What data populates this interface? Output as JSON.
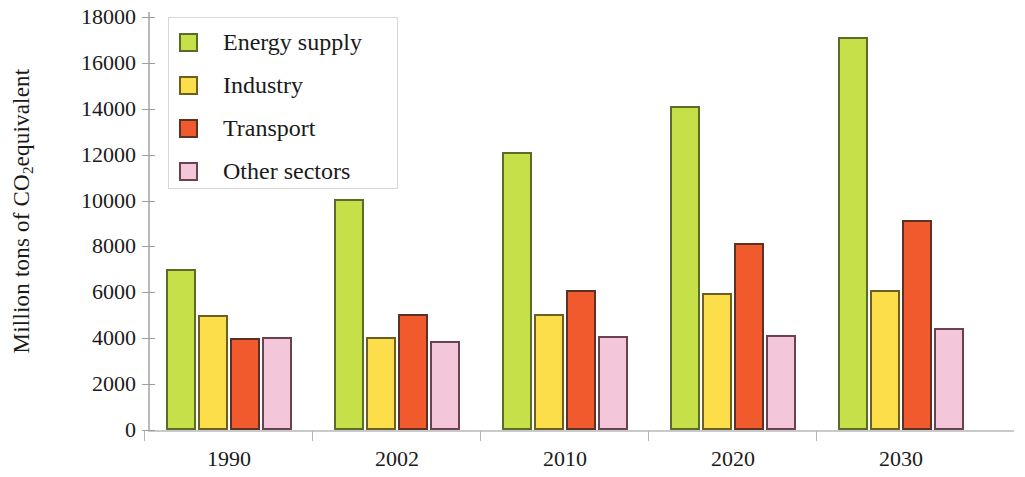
{
  "chart_data": {
    "type": "bar",
    "title": "",
    "subtitle": "",
    "xlabel": "",
    "ylabel": "Million tons of CO2equivalent",
    "ylabel_parts": {
      "before": "Million tons of CO",
      "sub": "2",
      "after": "equivalent"
    },
    "categories": [
      "1990",
      "2002",
      "2010",
      "2020",
      "2030"
    ],
    "series": [
      {
        "name": "Energy supply",
        "color": "#c6e04a",
        "values": [
          7000,
          10050,
          12100,
          14100,
          17150
        ]
      },
      {
        "name": "Industry",
        "color": "#fcdd4a",
        "values": [
          5000,
          4050,
          5050,
          5950,
          6100
        ]
      },
      {
        "name": "Transport",
        "color": "#f15a2c",
        "values": [
          4000,
          5050,
          6100,
          8150,
          9150
        ]
      },
      {
        "name": "Other sectors",
        "color": "#f3c6da",
        "values": [
          4050,
          3900,
          4100,
          4150,
          4450
        ]
      }
    ],
    "ylim": [
      0,
      18000
    ],
    "ytick_step": 2000,
    "ytick_labels": [
      "18000",
      "16000",
      "14000",
      "12000",
      "10000",
      "8000",
      "6000",
      "4000",
      "2000",
      "0"
    ],
    "grid": false,
    "legend_position": "top-left-inside",
    "legend_entries": [
      "Energy supply",
      "Industry",
      "Transport",
      "Other sectors"
    ]
  }
}
